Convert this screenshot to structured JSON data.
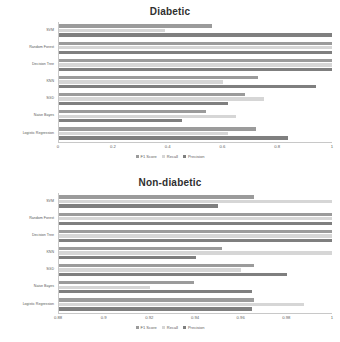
{
  "charts": [
    {
      "title": "Diabetic",
      "legend": [
        {
          "label": "F1 Score",
          "color": "#9b9b9b",
          "key": "f1"
        },
        {
          "label": "Recall",
          "color": "#d6d6d6",
          "key": "recall"
        },
        {
          "label": "Precision",
          "color": "#7f7f7f",
          "key": "precision"
        }
      ],
      "ticks": [
        "0",
        "0.2",
        "0.4",
        "0.6",
        "0.8",
        "1"
      ]
    },
    {
      "title": "Non-diabetic",
      "legend": [
        {
          "label": "F1 Score",
          "color": "#9b9b9b",
          "key": "f1"
        },
        {
          "label": "Recall",
          "color": "#d6d6d6",
          "key": "recall"
        },
        {
          "label": "Precision",
          "color": "#7f7f7f",
          "key": "precision"
        }
      ],
      "ticks": [
        "0.88",
        "0.9",
        "0.92",
        "0.94",
        "0.96",
        "0.98",
        "1"
      ]
    }
  ],
  "chart_data": [
    {
      "type": "bar",
      "orientation": "horizontal",
      "title": "Diabetic",
      "xlabel": "",
      "ylabel": "",
      "xlim": [
        0,
        1
      ],
      "xticks": [
        0,
        0.2,
        0.4,
        0.6,
        0.8,
        1
      ],
      "grid": false,
      "legend_position": "bottom",
      "categories": [
        "SVM",
        "Random Forest",
        "Decision Tree",
        "KNN",
        "SGD",
        "Naive Bayes",
        "Logistic Regression"
      ],
      "series": [
        {
          "name": "F1 Score",
          "color": "#9b9b9b",
          "values": [
            0.56,
            1.0,
            1.0,
            0.73,
            0.68,
            0.54,
            0.72
          ]
        },
        {
          "name": "Recall",
          "color": "#d6d6d6",
          "values": [
            0.39,
            1.0,
            1.0,
            0.6,
            0.75,
            0.65,
            0.62
          ]
        },
        {
          "name": "Precision",
          "color": "#7f7f7f",
          "values": [
            1.0,
            1.0,
            1.0,
            0.94,
            0.62,
            0.45,
            0.84
          ]
        }
      ]
    },
    {
      "type": "bar",
      "orientation": "horizontal",
      "title": "Non-diabetic",
      "xlabel": "",
      "ylabel": "",
      "xlim": [
        0.88,
        1
      ],
      "xticks": [
        0.88,
        0.9,
        0.92,
        0.94,
        0.96,
        0.98,
        1
      ],
      "grid": false,
      "legend_position": "bottom",
      "categories": [
        "SVM",
        "Random Forest",
        "Decision Tree",
        "KNN",
        "SGD",
        "Naive Bayes",
        "Logistic Regression"
      ],
      "series": [
        {
          "name": "F1 Score",
          "color": "#9b9b9b",
          "values": [
            0.9655,
            1.0,
            1.0,
            0.9515,
            0.9655,
            0.9395,
            0.9655
          ]
        },
        {
          "name": "Recall",
          "color": "#d6d6d6",
          "values": [
            1.0,
            1.0,
            1.0,
            1.0,
            0.96,
            0.92,
            0.9875
          ]
        },
        {
          "name": "Precision",
          "color": "#7f7f7f",
          "values": [
            0.95,
            1.0,
            1.0,
            0.94,
            0.98,
            0.965,
            0.965
          ]
        }
      ]
    }
  ]
}
